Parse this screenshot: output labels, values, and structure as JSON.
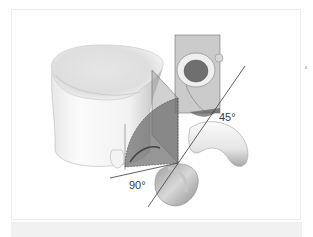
{
  "figure": {
    "annotations": [
      {
        "id": "angle-90",
        "text": "90°"
      },
      {
        "id": "angle-45",
        "text": "45°"
      }
    ]
  },
  "colors": {
    "bone_light": "#f7f7f7",
    "bone_mid": "#d9d9d9",
    "bone_shadow": "#9a9a9a",
    "plane_fill": "#7a7a7a",
    "line": "#3a3a3a",
    "frame_border": "#ececec",
    "band": "#f1f1f1"
  }
}
